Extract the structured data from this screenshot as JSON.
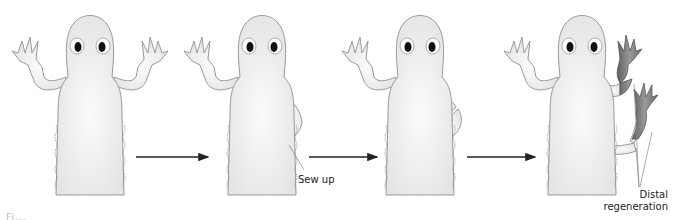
{
  "diagram": {
    "panels": [
      {
        "id": "intact",
        "description": "salamander with both forelimbs raised"
      },
      {
        "id": "sewn",
        "description": "right forelimb bent and sewn into flank",
        "label": "Sew up"
      },
      {
        "id": "cut",
        "description": "bent limb cut creating a bridge"
      },
      {
        "id": "regenerated",
        "description": "two limbs regenerating distally",
        "label": "Distal regeneration"
      }
    ],
    "arrows": 3,
    "labels": {
      "sew_up": "Sew up",
      "distal_line1": "Distal",
      "distal_line2": "regeneration"
    },
    "caption_fragment": "Fi...",
    "colors": {
      "body_fill": "#efefef",
      "body_stroke": "#9a9a9a",
      "regenerated_fill": "#7a7a7a",
      "arrow": "#222222",
      "leader_line": "#888888"
    }
  }
}
